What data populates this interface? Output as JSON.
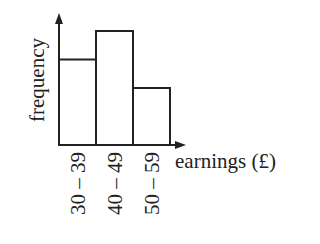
{
  "chart_data": {
    "type": "bar",
    "title": "",
    "xlabel": "earnings (£)",
    "ylabel": "frequency",
    "categories": [
      "30 – 39",
      "40 – 49",
      "50 – 59"
    ],
    "values": [
      3,
      4,
      2
    ],
    "value_note": "relative heights only; no y-axis scale shown",
    "grid": false,
    "legend": null
  }
}
